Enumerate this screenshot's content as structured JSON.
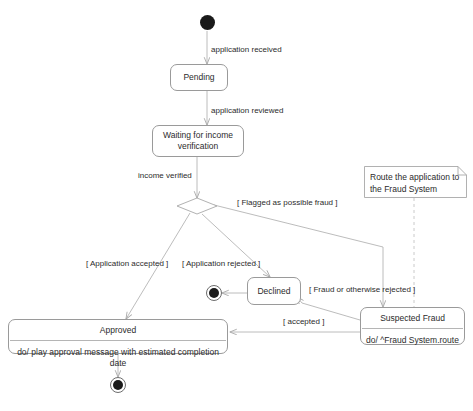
{
  "diagram": {
    "type": "uml-state-diagram",
    "canvas": {
      "width": 473,
      "height": 411
    },
    "colors": {
      "background": "#ffffff",
      "node_border": "#9a9a9a",
      "edge": "#b0b0b0",
      "text": "#2b2b2b",
      "filled_node": "#1a1a1a"
    }
  },
  "nodes": {
    "initial": {
      "kind": "initial-state",
      "label": ""
    },
    "pending": {
      "kind": "state",
      "name": "Pending"
    },
    "waiting": {
      "kind": "state",
      "name": "Waiting for income\nverification"
    },
    "decision": {
      "kind": "decision",
      "label": ""
    },
    "approved": {
      "kind": "composite-state",
      "name": "Approved",
      "activity": "do/ play approval message with estimated completion date"
    },
    "declined": {
      "kind": "state",
      "name": "Declined"
    },
    "suspected_fraud": {
      "kind": "composite-state",
      "name": "Suspected Fraud",
      "activity": "do/ ^Fraud System.route"
    },
    "final_declined": {
      "kind": "final-state",
      "label": ""
    },
    "final_approved": {
      "kind": "final-state",
      "label": ""
    }
  },
  "note": {
    "text": "Route the application to\nthe Fraud System",
    "attached_to": "suspected_fraud"
  },
  "transitions": [
    {
      "id": "t1",
      "from": "initial",
      "to": "pending",
      "label": "application received"
    },
    {
      "id": "t2",
      "from": "pending",
      "to": "waiting",
      "label": "application reviewed"
    },
    {
      "id": "t3",
      "from": "waiting",
      "to": "decision",
      "label": "income verified"
    },
    {
      "id": "t4",
      "from": "decision",
      "to": "suspected_fraud",
      "label": "[ Flagged as possible fraud ]"
    },
    {
      "id": "t5",
      "from": "decision",
      "to": "approved",
      "label": "[ Application accepted ]"
    },
    {
      "id": "t6",
      "from": "decision",
      "to": "declined",
      "label": "[ Application rejected ]"
    },
    {
      "id": "t7",
      "from": "suspected_fraud",
      "to": "declined",
      "label": "[ Fraud or otherwise rejected ]"
    },
    {
      "id": "t8",
      "from": "suspected_fraud",
      "to": "approved",
      "label": "[ accepted ]"
    },
    {
      "id": "t9",
      "from": "declined",
      "to": "final_declined",
      "label": ""
    },
    {
      "id": "t10",
      "from": "approved",
      "to": "final_approved",
      "label": ""
    }
  ]
}
